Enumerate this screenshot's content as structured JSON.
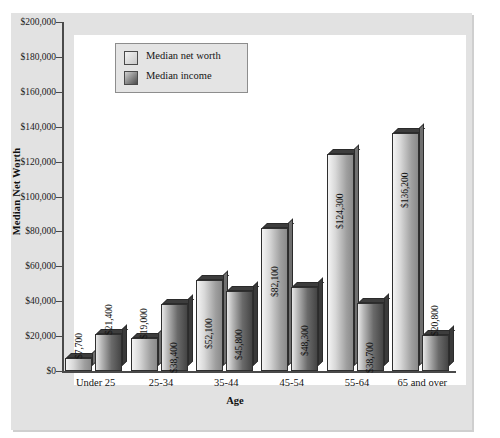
{
  "chart_data": {
    "type": "bar",
    "title": "",
    "xlabel": "Age",
    "ylabel": "Median Net Worth",
    "categories": [
      "Under 25",
      "25-34",
      "35-44",
      "45-54",
      "55-64",
      "65 and over"
    ],
    "series": [
      {
        "name": "Median net worth",
        "values": [
          7700,
          19000,
          52100,
          82100,
          124300,
          136200
        ],
        "labels": [
          "$7,700",
          "$19,000",
          "$52,100",
          "$82,100",
          "$124,300",
          "$136,200"
        ],
        "swatch": "light-gradient"
      },
      {
        "name": "Median income",
        "values": [
          21400,
          38400,
          45800,
          48300,
          38700,
          20800
        ],
        "labels": [
          "$21,400",
          "$38,400",
          "$45,800",
          "$48,300",
          "$38,700",
          "$20,800"
        ],
        "swatch": "dark-gradient"
      }
    ],
    "ylim": [
      0,
      200000
    ],
    "ytick_values": [
      0,
      20000,
      40000,
      60000,
      80000,
      100000,
      120000,
      140000,
      160000,
      180000,
      200000
    ],
    "ytick_labels": [
      "$0",
      "$20,000",
      "$40,000",
      "$60,000",
      "$80,000",
      "$100,000",
      "$120,000",
      "$140,000",
      "$160,000",
      "$180,000",
      "$200,000"
    ],
    "grid": false,
    "legend_position": "top-left",
    "label_rotation": -90,
    "colors": {
      "panel": "#e2e2e2",
      "plot_background": "#ffffff",
      "axis": "#4a4a4a",
      "net_worth_bar": "#c9c9c9",
      "income_bar": "#5a5a5a",
      "text": "#111111"
    }
  },
  "legend": {
    "items": [
      {
        "label": "Median net worth"
      },
      {
        "label": "Median income"
      }
    ]
  }
}
